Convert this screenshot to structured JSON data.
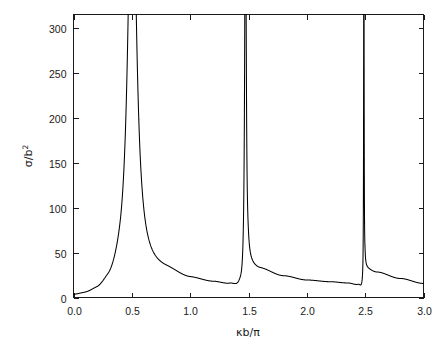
{
  "chart_data": {
    "type": "line",
    "title": "",
    "subtitle": "",
    "xlabel": "κb/π",
    "ylabel": "σ/b",
    "ylabel_exponent": "2",
    "xlim": [
      0.0,
      3.0
    ],
    "ylim": [
      0,
      315
    ],
    "grid": false,
    "legend": null,
    "xticks": [
      "0.0",
      "0.5",
      "1.0",
      "1.5",
      "2.0",
      "2.5",
      "3.0"
    ],
    "xtick_values": [
      0.0,
      0.5,
      1.0,
      1.5,
      2.0,
      2.5,
      3.0
    ],
    "yticks": [
      "0",
      "50",
      "100",
      "150",
      "200",
      "250",
      "300"
    ],
    "ytick_values": [
      0,
      50,
      100,
      150,
      200,
      250,
      300
    ],
    "line_color": "#000000",
    "background_color": "#ffffff",
    "frame_color": "#1a1a1a",
    "annotations": [
      "Three resonance peaks clipped at top of axis",
      "Curve approaches zero just below each resonance"
    ],
    "resonances": [
      {
        "center": 0.503,
        "half_width": 0.041,
        "peak_value": 315,
        "shape": "broad-symmetric"
      },
      {
        "center": 1.474,
        "half_width": 0.0075,
        "peak_value": 315,
        "shape": "narrow-asymmetric"
      },
      {
        "center": 2.489,
        "half_width": 0.0022,
        "peak_value": 315,
        "shape": "very-narrow-asymmetric"
      }
    ],
    "series": [
      {
        "name": "cross-section",
        "x": [
          0.0,
          0.05,
          0.1,
          0.15,
          0.2,
          0.25,
          0.3,
          0.33,
          0.36,
          0.39,
          0.42,
          0.44,
          0.46,
          0.47,
          0.48,
          0.49,
          0.495,
          0.5,
          0.505,
          0.51,
          0.52,
          0.53,
          0.54,
          0.56,
          0.58,
          0.6,
          0.65,
          0.7,
          0.75,
          0.8,
          0.85,
          0.9,
          0.95,
          1.0,
          1.05,
          1.1,
          1.15,
          1.2,
          1.25,
          1.3,
          1.34,
          1.38,
          1.41,
          1.43,
          1.45,
          1.46,
          1.465,
          1.47,
          1.473,
          1.476,
          1.479,
          1.482,
          1.486,
          1.49,
          1.5,
          1.52,
          1.55,
          1.6,
          1.65,
          1.7,
          1.8,
          1.9,
          2.0,
          2.1,
          2.2,
          2.3,
          2.38,
          2.43,
          2.46,
          2.475,
          2.484,
          2.488,
          2.491,
          2.494,
          2.498,
          2.505,
          2.52,
          2.55,
          2.6,
          2.7,
          2.8,
          2.9,
          3.0
        ],
        "y": [
          0.2,
          0.4,
          0.9,
          1.8,
          3.4,
          6.2,
          12.0,
          18.5,
          30.0,
          52.0,
          98.0,
          145.0,
          225.0,
          268.0,
          300.0,
          313.0,
          315.0,
          315.0,
          315.0,
          313.0,
          296.0,
          262.0,
          222.0,
          158.0,
          116.0,
          90.0,
          56.0,
          41.0,
          33.0,
          28.5,
          25.5,
          23.0,
          21.2,
          19.8,
          18.6,
          17.6,
          16.8,
          16.0,
          15.2,
          14.3,
          13.3,
          11.8,
          10.0,
          8.2,
          5.4,
          3.2,
          2.1,
          1.1,
          0.6,
          2.5,
          60.0,
          180.0,
          290.0,
          315.0,
          315.0,
          240.0,
          120.0,
          60.0,
          40.0,
          31.0,
          23.5,
          20.5,
          19.0,
          18.0,
          17.2,
          16.4,
          15.4,
          14.2,
          12.4,
          9.8,
          5.2,
          2.2,
          0.8,
          40.0,
          240.0,
          315.0,
          200.0,
          95.0,
          50.0,
          28.0,
          21.0,
          17.5,
          15.5
        ]
      }
    ]
  },
  "axes": {
    "x_title": "κb/π",
    "y_title_main": "σ/b",
    "y_title_sup": "2"
  }
}
